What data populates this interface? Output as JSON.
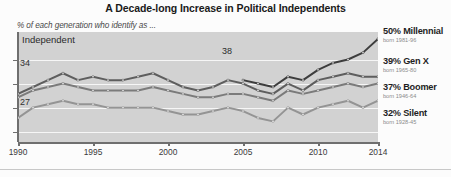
{
  "chart_data": {
    "type": "line",
    "title": "A Decade-long Increase in Political Independents",
    "subtitle": "% of each generation who identify as ...",
    "xlabel": "",
    "ylabel": "",
    "xlim": [
      1990,
      2014
    ],
    "ylim": [
      20,
      52
    ],
    "grid": true,
    "legend_position": "right",
    "xticks": [
      "1990",
      "1995",
      "2000",
      "2005",
      "2010",
      "2014"
    ],
    "annotations": [
      {
        "text": "Independent",
        "x": 1990.5,
        "y": 46
      },
      {
        "text": "34",
        "x": 1990,
        "y": 34
      },
      {
        "text": "27",
        "x": 1990,
        "y": 27
      },
      {
        "text": "38",
        "x": 2005,
        "y": 41
      }
    ],
    "series": [
      {
        "name": "Millennial",
        "color": "#3d3d3d",
        "end_value": 50,
        "start_value": 38,
        "x": [
          2005,
          2006,
          2007,
          2008,
          2009,
          2010,
          2011,
          2012,
          2013,
          2014
        ],
        "values": [
          38,
          37,
          36,
          39,
          38,
          41,
          43,
          44,
          46,
          50
        ]
      },
      {
        "name": "Gen X",
        "color": "#5e5e5e",
        "end_value": 39,
        "start_value": 34,
        "x": [
          1990,
          1991,
          1992,
          1993,
          1994,
          1995,
          1996,
          1997,
          1998,
          1999,
          2000,
          2001,
          2002,
          2003,
          2004,
          2005,
          2006,
          2007,
          2008,
          2009,
          2010,
          2011,
          2012,
          2013,
          2014
        ],
        "values": [
          34,
          36,
          38,
          40,
          38,
          39,
          38,
          38,
          39,
          40,
          38,
          36,
          35,
          36,
          38,
          37,
          35,
          34,
          37,
          35,
          38,
          39,
          40,
          39,
          39
        ]
      },
      {
        "name": "Boomer",
        "color": "#7b7b7b",
        "end_value": 37,
        "start_value": 34,
        "x": [
          1990,
          1991,
          1992,
          1993,
          1994,
          1995,
          1996,
          1997,
          1998,
          1999,
          2000,
          2001,
          2002,
          2003,
          2004,
          2005,
          2006,
          2007,
          2008,
          2009,
          2010,
          2011,
          2012,
          2013,
          2014
        ],
        "values": [
          33,
          35,
          36,
          37,
          36,
          35,
          35,
          35,
          35,
          36,
          35,
          34,
          33,
          33,
          34,
          34,
          33,
          32,
          35,
          34,
          35,
          36,
          37,
          36,
          37
        ]
      },
      {
        "name": "Silent",
        "color": "#949494",
        "end_value": 32,
        "start_value": 27,
        "x": [
          1990,
          1991,
          1992,
          1993,
          1994,
          1995,
          1996,
          1997,
          1998,
          1999,
          2000,
          2001,
          2002,
          2003,
          2004,
          2005,
          2006,
          2007,
          2008,
          2009,
          2010,
          2011,
          2012,
          2013,
          2014
        ],
        "values": [
          27,
          30,
          31,
          32,
          31,
          31,
          30,
          30,
          30,
          30,
          29,
          28,
          28,
          29,
          30,
          29,
          27,
          26,
          30,
          28,
          30,
          31,
          32,
          30,
          32
        ]
      }
    ],
    "gridline_values": [
      44,
      37,
      30,
      23
    ]
  },
  "legend": {
    "items": [
      {
        "value_label": "50% Millennial",
        "born": "born 1981-96"
      },
      {
        "value_label": "39% Gen X",
        "born": "born 1965-80"
      },
      {
        "value_label": "37% Boomer",
        "born": "born 1946-64"
      },
      {
        "value_label": "32% Silent",
        "born": "born 1928-45"
      }
    ]
  },
  "colors": {
    "plot_background": "#d2d2d2",
    "gridline": "#f6f6f6",
    "axis": "#6f6f6f"
  }
}
